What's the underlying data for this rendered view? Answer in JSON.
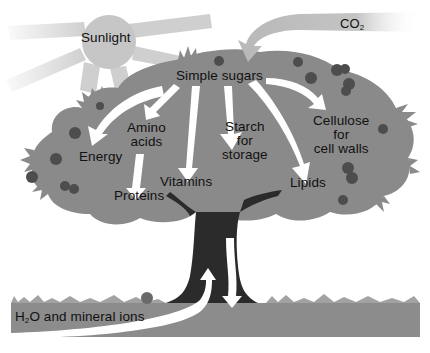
{
  "diagram": {
    "colors": {
      "background": "#ffffff",
      "canopy": "#8a8a8a",
      "trunk": "#2b2b2b",
      "ground": "#8c8c8c",
      "sun": "#c8c8c8",
      "sun_rays": "#cfcfcf",
      "arrows": "#ffffff",
      "fruit": "#4d4d4d",
      "co2_arrow": "#c4c4c4",
      "text": "#111111"
    },
    "labels": {
      "sunlight": "Sunlight",
      "co2_main": "CO",
      "co2_sub": "2",
      "simple_sugars": "Simple sugars",
      "amino_line1": "Amino",
      "amino_line2": "acids",
      "energy": "Energy",
      "proteins": "Proteins",
      "vitamins": "Vitamins",
      "starch_line1": "Starch",
      "starch_line2": "for",
      "starch_line3": "storage",
      "cellulose_line1": "Cellulose",
      "cellulose_line2": "for",
      "cellulose_line3": "cell walls",
      "lipids": "Lipids",
      "water_h": "H",
      "water_sub": "2",
      "water_rest": "O and mineral ions"
    },
    "nodes": [
      {
        "id": "sunlight",
        "label": "Sunlight",
        "type": "input"
      },
      {
        "id": "co2",
        "label": "CO2",
        "type": "input"
      },
      {
        "id": "water",
        "label": "H2O and mineral ions",
        "type": "input"
      },
      {
        "id": "sugars",
        "label": "Simple sugars",
        "type": "hub"
      },
      {
        "id": "energy",
        "label": "Energy",
        "type": "output"
      },
      {
        "id": "amino",
        "label": "Amino acids",
        "type": "intermediate"
      },
      {
        "id": "proteins",
        "label": "Proteins",
        "type": "output"
      },
      {
        "id": "vitamins",
        "label": "Vitamins",
        "type": "output"
      },
      {
        "id": "starch",
        "label": "Starch for storage",
        "type": "output"
      },
      {
        "id": "cellulose",
        "label": "Cellulose for cell walls",
        "type": "output"
      },
      {
        "id": "lipids",
        "label": "Lipids",
        "type": "output"
      }
    ],
    "edges": [
      {
        "from": "co2",
        "to": "sugars"
      },
      {
        "from": "sugars",
        "to": "energy"
      },
      {
        "from": "sugars",
        "to": "amino"
      },
      {
        "from": "amino",
        "to": "proteins"
      },
      {
        "from": "sugars",
        "to": "vitamins"
      },
      {
        "from": "sugars",
        "to": "starch"
      },
      {
        "from": "starch",
        "to": "roots"
      },
      {
        "from": "sugars",
        "to": "lipids"
      },
      {
        "from": "sugars",
        "to": "cellulose"
      },
      {
        "from": "water",
        "to": "trunk"
      }
    ]
  }
}
